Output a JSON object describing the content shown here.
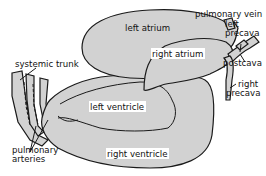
{
  "diagram": {
    "fill_color": "#d2d2d2",
    "outline_color": "#1a1a1a",
    "labels": {
      "left_atrium": "left atrium",
      "right_atrium": "right atrium",
      "left_ventricle": "left ventricle",
      "right_ventricle": "right ventricle",
      "pulmonary_vein": "pulmonary vein",
      "left_precava_line1": "left",
      "left_precava_line2": "precava",
      "postcava": "postcava",
      "right_precava_line1": "right",
      "right_precava_line2": "precava",
      "systemic_trunk": "systemic trunk",
      "pulmonary_arteries_line1": "pulmonary",
      "pulmonary_arteries_line2": "arteries"
    }
  }
}
